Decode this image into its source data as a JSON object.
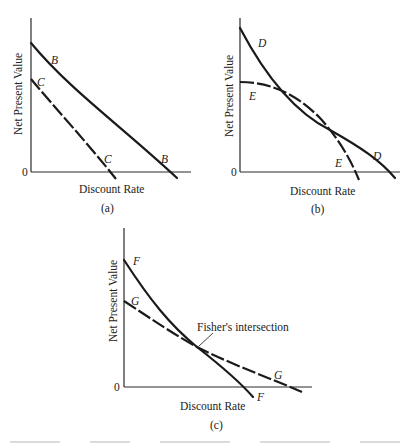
{
  "panels": [
    {
      "id": "a",
      "caption": "(a)",
      "ylabel": "Net Present Value",
      "xlabel": "Discount Rate",
      "origin_label": "0",
      "curves": [
        {
          "name": "B",
          "style": "solid",
          "label_top": "B",
          "label_bottom": "B"
        },
        {
          "name": "C",
          "style": "dashed",
          "label_top": "C",
          "label_bottom": "C"
        }
      ]
    },
    {
      "id": "b",
      "caption": "(b)",
      "ylabel": "Net Present Value",
      "xlabel": "Discount Rate",
      "origin_label": "0",
      "curves": [
        {
          "name": "D",
          "style": "solid",
          "label_top": "D",
          "label_bottom": "D"
        },
        {
          "name": "E",
          "style": "dashed",
          "label_top": "E",
          "label_bottom": "E"
        }
      ]
    },
    {
      "id": "c",
      "caption": "(c)",
      "ylabel": "Net Present Value",
      "xlabel": "Discount Rate",
      "origin_label": "0",
      "annotation": "Fisher's intersection",
      "curves": [
        {
          "name": "F",
          "style": "solid",
          "label_top": "F",
          "label_bottom": "F"
        },
        {
          "name": "G",
          "style": "dashed",
          "label_top": "G",
          "label_bottom": "G"
        }
      ]
    }
  ]
}
